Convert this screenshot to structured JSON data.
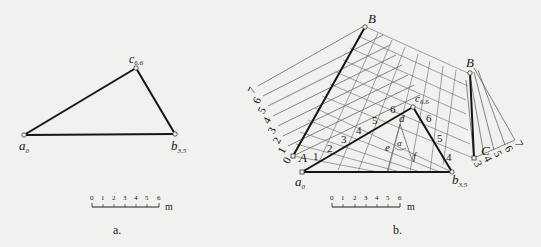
{
  "figure_a": {
    "caption": "a.",
    "points": {
      "a": {
        "label": "a",
        "sub": "0"
      },
      "b": {
        "label": "b",
        "sub": "3.5"
      },
      "c": {
        "label": "c",
        "sub": "6.6"
      }
    },
    "scale": {
      "ticks": [
        "0",
        "1",
        "2",
        "3",
        "4",
        "5",
        "6"
      ],
      "unit": "m"
    }
  },
  "figure_b": {
    "caption": "b.",
    "points": {
      "B_top": {
        "label": "B"
      },
      "B_right": {
        "label": "B"
      },
      "A": {
        "label": "A"
      },
      "C": {
        "label": "C"
      },
      "a": {
        "label": "a",
        "sub": "0"
      },
      "b": {
        "label": "b",
        "sub": "3.5"
      },
      "c": {
        "label": "c",
        "sub": "6.6"
      },
      "d": {
        "label": "d"
      },
      "e": {
        "label": "e"
      },
      "f": {
        "label": "f"
      },
      "alpha": {
        "label": "α"
      }
    },
    "left_scale": [
      "0",
      "1",
      "2",
      "3",
      "4",
      "5",
      "6",
      "7"
    ],
    "right_scale": [
      "3",
      "4",
      "5",
      "6",
      "7"
    ],
    "ac_contours": [
      "1",
      "2",
      "3",
      "4",
      "5",
      "6"
    ],
    "cb_contours": [
      "6",
      "5",
      "4"
    ],
    "scale": {
      "ticks": [
        "0",
        "1",
        "2",
        "3",
        "4",
        "5",
        "6"
      ],
      "unit": "m"
    }
  }
}
